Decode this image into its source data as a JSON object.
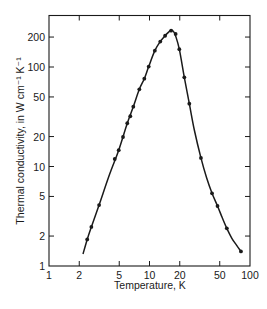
{
  "chart_data": {
    "type": "line",
    "title": "",
    "xlabel": "Temperature, K",
    "ylabel": "Thermal conductivity, in W cm⁻¹ K⁻¹",
    "xscale": "log",
    "yscale": "log",
    "xlim": [
      1,
      100
    ],
    "ylim": [
      1,
      300
    ],
    "grid": false,
    "legend": null,
    "x_ticks": [
      1,
      2,
      5,
      10,
      20,
      50,
      100
    ],
    "x_tick_labels": [
      "1",
      "2",
      "5",
      "10",
      "20",
      "50",
      "100"
    ],
    "y_ticks": [
      1,
      2,
      5,
      10,
      20,
      50,
      100,
      200
    ],
    "y_tick_labels": [
      "1",
      "2",
      "5",
      "10",
      "20",
      "50",
      "100",
      "200"
    ],
    "series": [
      {
        "name": "measured",
        "style": "markers",
        "x": [
          2.4,
          2.64,
          3.15,
          4.51,
          4.94,
          5.45,
          6.01,
          6.44,
          6.9,
          7.92,
          8.88,
          9.82,
          11.3,
          12.8,
          14.3,
          16.4,
          18.2,
          19.8,
          22.2,
          24.9,
          32.5,
          41.9,
          47.5,
          58.8,
          81.3
        ],
        "y": [
          1.85,
          2.47,
          4.1,
          11.9,
          14.6,
          19.8,
          27.2,
          32.0,
          39.9,
          59.7,
          76.3,
          101,
          146,
          180,
          206,
          232,
          215,
          151,
          78.7,
          42.8,
          12.2,
          5.38,
          4.01,
          2.39,
          1.4
        ]
      },
      {
        "name": "fit curve",
        "style": "line",
        "x": [
          2.18,
          2.4,
          2.64,
          3.15,
          4.0,
          4.94,
          6.01,
          6.9,
          7.92,
          8.88,
          9.82,
          11.3,
          12.8,
          14.3,
          15.5,
          16.4,
          17.3,
          18.2,
          19.8,
          22.2,
          24.9,
          28.0,
          32.5,
          37.0,
          41.9,
          47.5,
          53.0,
          58.8,
          66.0,
          74.0,
          81.3
        ],
        "y": [
          1.32,
          1.85,
          2.47,
          4.1,
          8.3,
          14.6,
          27.2,
          39.9,
          59.7,
          76.3,
          101,
          146,
          180,
          206,
          224,
          235,
          228,
          205,
          151,
          78.7,
          42.8,
          23.0,
          12.2,
          7.7,
          5.38,
          4.01,
          3.05,
          2.39,
          1.9,
          1.6,
          1.4
        ]
      }
    ]
  }
}
